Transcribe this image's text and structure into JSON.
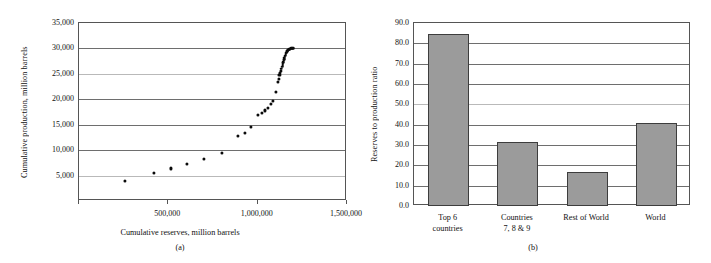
{
  "figure": {
    "background": "#ffffff",
    "panels": [
      "(a)",
      "(b)"
    ]
  },
  "panel_a": {
    "caption": "(a)",
    "xlabel": "Cumulative reserves, million barrels",
    "ylabel": "Cumulative production, million barrels",
    "yticks": [
      "35,000",
      "30,000",
      "25,000",
      "20,000",
      "15,000",
      "10,000",
      "5,000"
    ],
    "xticks": [
      "500,000",
      "1,000,000",
      "1,500,000"
    ]
  },
  "panel_b": {
    "caption": "(b)",
    "ylabel": "Reserves to production ratio",
    "yticks": [
      "90.0",
      "80.0",
      "70.0",
      "60.0",
      "50.0",
      "40.0",
      "30.0",
      "20.0",
      "10.0",
      "0.0"
    ],
    "categories": [
      {
        "line1": "Top 6",
        "line2": "countries"
      },
      {
        "line1": "Countries",
        "line2": "7, 8 & 9"
      },
      {
        "line1": "Rest of World",
        "line2": ""
      },
      {
        "line1": "World",
        "line2": ""
      }
    ]
  },
  "chart_data": [
    {
      "type": "scatter",
      "panel": "(a)",
      "title": "",
      "xlabel": "Cumulative reserves, million barrels",
      "ylabel": "Cumulative production, million barrels",
      "xlim": [
        0,
        1500000
      ],
      "ylim": [
        0,
        35000
      ],
      "xticks": [
        0,
        500000,
        1000000,
        1500000
      ],
      "yticks": [
        0,
        5000,
        10000,
        15000,
        20000,
        25000,
        30000,
        35000
      ],
      "grid": "horizontal",
      "legend": "none",
      "marker": "filled-circle",
      "marker_color": "#0b0b0b",
      "points": [
        [
          258000,
          3950
        ],
        [
          418000,
          5450
        ],
        [
          516000,
          6400
        ],
        [
          604000,
          7350
        ],
        [
          697000,
          8250
        ],
        [
          800000,
          9400
        ],
        [
          888000,
          12850
        ],
        [
          930000,
          13450
        ],
        [
          963000,
          14500
        ],
        [
          1000000,
          16900
        ],
        [
          1022000,
          17300
        ],
        [
          1040000,
          17800
        ],
        [
          1056000,
          18350
        ],
        [
          1072000,
          19050
        ],
        [
          1088000,
          19750
        ],
        [
          1102000,
          21400
        ],
        [
          1112000,
          23400
        ],
        [
          1118000,
          24050
        ],
        [
          1122000,
          24700
        ],
        [
          1126000,
          25200
        ],
        [
          1130000,
          25650
        ],
        [
          1133000,
          26050
        ],
        [
          1136000,
          26400
        ],
        [
          1139000,
          26750
        ],
        [
          1141000,
          27050
        ],
        [
          1143000,
          27350
        ],
        [
          1146000,
          27650
        ],
        [
          1148000,
          27900
        ],
        [
          1150000,
          28150
        ],
        [
          1152000,
          28400
        ],
        [
          1154000,
          28600
        ],
        [
          1156000,
          28800
        ],
        [
          1158000,
          29000
        ],
        [
          1160000,
          29150
        ],
        [
          1162000,
          29300
        ],
        [
          1164000,
          29450
        ],
        [
          1166000,
          29550
        ],
        [
          1169000,
          29650
        ],
        [
          1172000,
          29750
        ],
        [
          1175000,
          29830
        ],
        [
          1179000,
          29900
        ],
        [
          1183000,
          29950
        ],
        [
          1188000,
          30000
        ],
        [
          1193000,
          30030
        ],
        [
          1198000,
          30060
        ]
      ]
    },
    {
      "type": "bar",
      "panel": "(b)",
      "title": "",
      "xlabel": "",
      "ylabel": "Reserves to production ratio",
      "categories": [
        "Top 6 countries",
        "Countries 7, 8 & 9",
        "Rest of World",
        "World"
      ],
      "values": [
        84.5,
        31.3,
        16.7,
        41.0
      ],
      "ylim": [
        0,
        90
      ],
      "yticks": [
        0.0,
        10.0,
        20.0,
        30.0,
        40.0,
        50.0,
        60.0,
        70.0,
        80.0,
        90.0
      ],
      "grid": "horizontal",
      "legend": "none",
      "bar_fill": "#9b9b9b",
      "bar_border": "#3d3d3d"
    }
  ]
}
